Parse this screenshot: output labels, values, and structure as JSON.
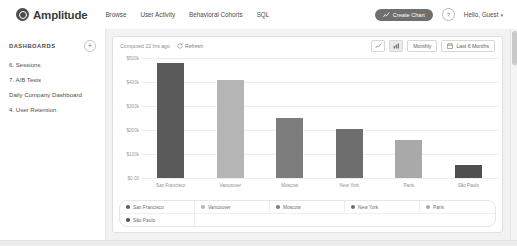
{
  "topnav": {
    "brand": "Amplitude",
    "links": [
      {
        "label": "Browse"
      },
      {
        "label": "User Activity"
      },
      {
        "label": "Behavioral Cohorts"
      },
      {
        "label": "SQL"
      }
    ],
    "create_chart_label": "Create Chart",
    "help_badge": "?",
    "account_label": "Hello, Guest",
    "account_caret": "▾",
    "accent_button_color": "#6f6f6f"
  },
  "sidebar": {
    "title": "DASHBOARDS",
    "add_label": "+",
    "items": [
      {
        "label": "6. Sessions"
      },
      {
        "label": "7. A/B Tests"
      },
      {
        "label": "Daily Company Dashboard"
      },
      {
        "label": "4. User Retention"
      }
    ]
  },
  "card": {
    "computed_text": "Computed 22 hrs ago",
    "refresh_label": "Refresh",
    "line_chart_icon": "line-chart-icon",
    "bar_chart_icon": "bar-chart-icon",
    "interval_label": "Monthly",
    "date_range_label": "Last 6 Months",
    "calendar_icon": "calendar-icon"
  },
  "chart_data": {
    "type": "bar",
    "title": "",
    "xlabel": "",
    "ylabel": "",
    "categories": [
      "San Francisco",
      "Vancouver",
      "Moscow",
      "New York",
      "Paris",
      "São Paulo"
    ],
    "values": [
      480000,
      410000,
      250000,
      205000,
      160000,
      55000
    ],
    "colors": [
      "#5a5a5a",
      "#b5b5b5",
      "#7d7d7d",
      "#6e6e6e",
      "#a9a9a9",
      "#4f4f4f"
    ],
    "ylim": [
      0,
      500000
    ],
    "ytick_values": [
      0,
      100000,
      200000,
      300000,
      400000,
      500000
    ],
    "ytick_labels": [
      "$0.00",
      "$100k",
      "$200k",
      "$300k",
      "$400k",
      "$500k"
    ],
    "grid": true,
    "legend_position": "bottom"
  },
  "legend": {
    "rows": [
      [
        {
          "label": "San Francisco",
          "color": "#5a5a5a"
        },
        {
          "label": "Vancouver",
          "color": "#b5b5b5"
        },
        {
          "label": "Moscow",
          "color": "#7d7d7d"
        },
        {
          "label": "New York",
          "color": "#6e6e6e"
        },
        {
          "label": "Paris",
          "color": "#a9a9a9"
        }
      ],
      [
        {
          "label": "São Paulo",
          "color": "#4f4f4f"
        }
      ]
    ]
  }
}
